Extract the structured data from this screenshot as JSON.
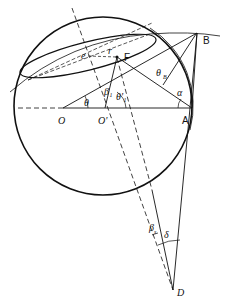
{
  "diagram": {
    "type": "geometric construction",
    "labels": {
      "B": "B",
      "F": "F",
      "O": "O",
      "O_prime": "O'",
      "A": "A",
      "D": "D",
      "e": "e",
      "r": "r",
      "theta": "θ",
      "theta1_prime": "θ'₁",
      "beta1": "β₁",
      "theta_B": "θ",
      "theta_B_sub": "B",
      "alpha": "α",
      "beta_s": "β",
      "beta_s_sub": "s",
      "delta": "δ"
    },
    "colors": {
      "stroke": "#111111",
      "background": "#ffffff"
    }
  }
}
